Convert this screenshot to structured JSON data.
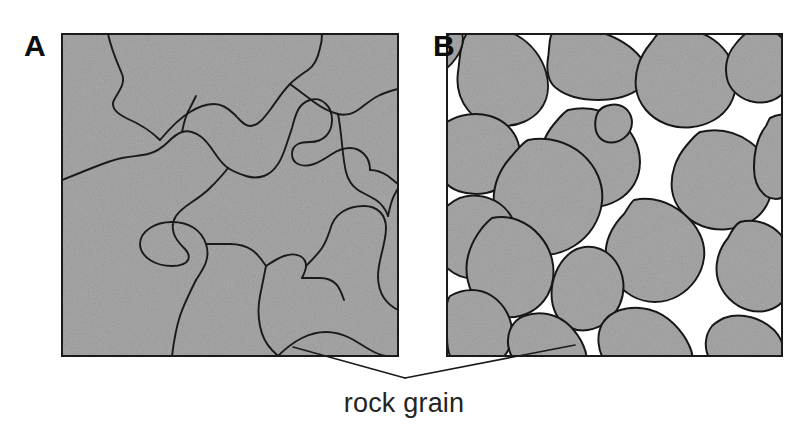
{
  "figure": {
    "background_color": "#ffffff",
    "width": 808,
    "height": 439,
    "caption": "rock grain",
    "caption_color": "#242424",
    "grain_fill_color": "#a9a9a9",
    "grain_fill_color_dark": "#9d9d9d",
    "pore_fill_color": "#ffffff",
    "outline_color": "#1a1a1a",
    "border_color": "#1a1a1a",
    "leader_line_color": "#1a1a1a"
  },
  "panels": [
    {
      "id": "panel-a",
      "label": "A",
      "label_x": 24,
      "label_y": 31,
      "texture_type": "crystalline-interlocking",
      "description": "Interlocking rock grains with no pore space",
      "has_pore_space": false,
      "frame": {
        "x": 62,
        "y": 34,
        "width": 336,
        "height": 322
      },
      "grain_count": 13
    },
    {
      "id": "panel-b",
      "label": "B",
      "label_x": 433,
      "label_y": 31,
      "texture_type": "clastic-rounded",
      "description": "Rounded separate rock grains with pore space between them",
      "has_pore_space": true,
      "frame": {
        "x": 447,
        "y": 34,
        "width": 335,
        "height": 322
      },
      "grain_count": 22
    }
  ],
  "leader_lines": [
    {
      "id": "leader-a",
      "from_panel": "panel-a",
      "points": "293,347 405,378"
    },
    {
      "id": "leader-b",
      "from_panel": "panel-b",
      "points": "575,345 405,378"
    }
  ]
}
